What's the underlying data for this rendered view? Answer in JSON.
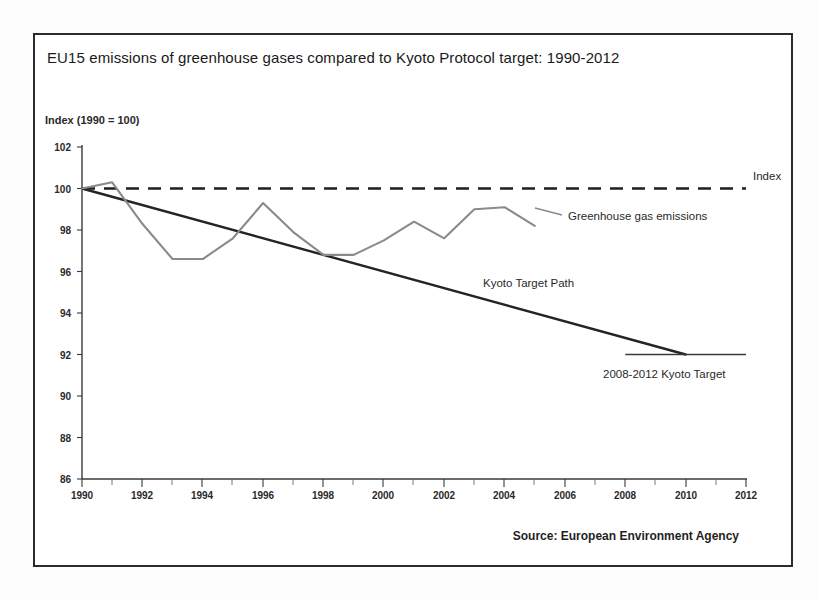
{
  "chart_title": "EU15 emissions of greenhouse gases compared to Kyoto Protocol target: 1990-2012",
  "y_axis_label": "Index (1990 = 100)",
  "source_note": "Source: European Environment Agency",
  "annotations": {
    "index": "Index",
    "emissions": "Greenhouse gas emissions",
    "target_path": "Kyoto Target Path",
    "kyoto_target": "2008-2012 Kyoto Target"
  },
  "colors": {
    "frame": "#2b2b2b",
    "emissions_line": "#8a8a8a",
    "index_line": "#1f1f1f",
    "target_path_line": "#242424",
    "target_line": "#3a3a3a",
    "text": "#1a1a1a"
  },
  "chart_data": {
    "type": "line",
    "title": "EU15 emissions of greenhouse gases compared to Kyoto Protocol target: 1990-2012",
    "xlabel": "",
    "ylabel": "Index (1990 = 100)",
    "xlim": [
      1990,
      2012
    ],
    "ylim": [
      86,
      102
    ],
    "xticks": [
      1990,
      1992,
      1994,
      1996,
      1998,
      2000,
      2002,
      2004,
      2006,
      2008,
      2010,
      2012
    ],
    "xticklabels": [
      "1990",
      "1992",
      "1994",
      "1996",
      "1998",
      "2000",
      "2002",
      "2004",
      "2006",
      "2008",
      "2010",
      "2012"
    ],
    "minor_xticks": [
      1991,
      1993,
      1995,
      1997,
      1999,
      2001,
      2003,
      2005,
      2007,
      2009,
      2011
    ],
    "yticks": [
      86,
      88,
      90,
      92,
      94,
      96,
      98,
      100,
      102
    ],
    "yticklabels": [
      "86",
      "88",
      "90",
      "92",
      "94",
      "96",
      "98",
      "100",
      "102"
    ],
    "grid": false,
    "legend_position": "inline-annotations",
    "series": [
      {
        "name": "Greenhouse gas emissions",
        "style": "solid-grey",
        "x": [
          1990,
          1991,
          1992,
          1993,
          1994,
          1995,
          1996,
          1997,
          1998,
          1999,
          2000,
          2001,
          2002,
          2003,
          2004,
          2005
        ],
        "values": [
          100.0,
          100.3,
          98.3,
          96.6,
          96.6,
          97.6,
          99.3,
          97.9,
          96.8,
          96.8,
          97.5,
          98.4,
          97.6,
          99.0,
          99.1,
          98.2
        ]
      },
      {
        "name": "Index",
        "style": "dashed-black",
        "x": [
          1990,
          2012
        ],
        "values": [
          100.0,
          100.0
        ]
      },
      {
        "name": "Kyoto Target Path",
        "style": "solid-black",
        "x": [
          1990,
          2010
        ],
        "values": [
          100.0,
          92.0
        ]
      },
      {
        "name": "2008-2012 Kyoto Target",
        "style": "solid-thin",
        "x": [
          2008,
          2012
        ],
        "values": [
          92.0,
          92.0
        ]
      }
    ]
  }
}
